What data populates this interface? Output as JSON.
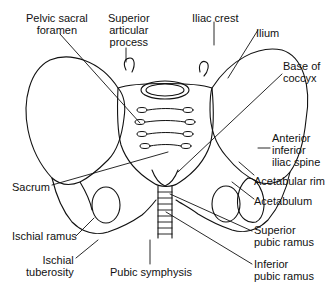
{
  "diagram": {
    "labels": {
      "pelvic_sacral_foramen": "Pelvic sacral\nforamen",
      "superior_articular_process": "Superior\narticular\nprocess",
      "iliac_crest": "Iliac crest",
      "ilium": "Ilium",
      "base_of_coccyx": "Base of\ncoccyx",
      "anterior_inferior_iliac_spine": "Anterior\ninferior\niliac spine",
      "acetabular_rim": "Acetabular rim",
      "acetabulum": "Acetabulum",
      "sacrum": "Sacrum",
      "ischial_ramus": "Ischial ramus",
      "ischial_tuberosity": "Ischial\ntuberosity",
      "pubic_symphysis": "Pubic symphysis",
      "superior_pubic_ramus": "Superior\npubic ramus",
      "inferior_pubic_ramus": "Inferior\npubic ramus"
    },
    "colors": {
      "line": "#111111",
      "background": "#ffffff"
    }
  }
}
